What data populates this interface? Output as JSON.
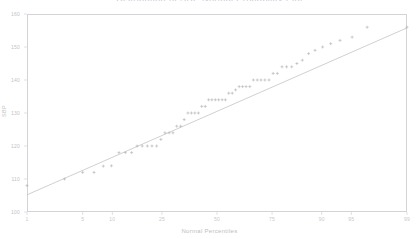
{
  "chart_data": {
    "type": "scatter",
    "title": "Distribution of SBP  Normal Probability Plot",
    "xlabel": "Normal Percentiles",
    "ylabel": "SBP",
    "xlim": [
      1,
      99
    ],
    "ylim": [
      100,
      160
    ],
    "grid": false,
    "legend": "none",
    "marker": "plus",
    "marker_color": "#b0b0b6",
    "line_color": "#c0c0c6",
    "frame_color": "#d4d4d8",
    "background": "#ffffff",
    "xticks": [
      1,
      5,
      10,
      25,
      50,
      75,
      90,
      95,
      99
    ],
    "xtick_labels": [
      "1",
      "5",
      "10",
      "25",
      "50",
      "75",
      "90",
      "95",
      "99"
    ],
    "yticks": [
      100,
      110,
      120,
      130,
      140,
      150,
      160
    ],
    "ytick_labels": [
      "100",
      "110",
      "120",
      "130",
      "140",
      "150",
      "160"
    ],
    "reference_line": {
      "description": "normal reference line",
      "x": [
        1,
        99
      ],
      "y": [
        105.2,
        155.8
      ]
    },
    "series": [
      {
        "name": "SBP quantiles",
        "x": [
          1.0,
          3.1,
          5.0,
          6.6,
          8.2,
          9.8,
          11.5,
          13.1,
          14.8,
          16.4,
          18.0,
          19.7,
          21.3,
          23.0,
          24.6,
          26.2,
          27.9,
          29.5,
          31.1,
          32.8,
          34.4,
          36.1,
          37.7,
          39.3,
          41.0,
          42.6,
          44.3,
          45.9,
          47.5,
          49.2,
          50.8,
          52.5,
          54.1,
          55.7,
          57.4,
          59.0,
          60.7,
          62.3,
          63.9,
          65.6,
          67.2,
          68.9,
          70.5,
          72.1,
          73.8,
          75.4,
          77.0,
          78.7,
          80.3,
          82.0,
          83.6,
          85.2,
          86.9,
          88.5,
          90.2,
          91.8,
          93.4,
          95.1,
          96.7,
          99.0
        ],
        "y": [
          108.0,
          110.0,
          112.0,
          112.0,
          113.9,
          114.0,
          118.0,
          118.0,
          118.0,
          120.0,
          120.0,
          120.0,
          120.0,
          120.0,
          122.0,
          124.0,
          124.0,
          124.0,
          126.0,
          126.0,
          128.0,
          130.0,
          130.0,
          130.0,
          130.0,
          132.0,
          132.0,
          134.0,
          134.0,
          134.0,
          134.0,
          134.0,
          134.0,
          136.0,
          136.0,
          137.0,
          138.0,
          138.0,
          138.0,
          138.0,
          140.0,
          140.0,
          140.0,
          140.0,
          140.0,
          142.0,
          142.0,
          144.0,
          144.0,
          144.0,
          145.0,
          146.0,
          148.0,
          149.0,
          150.0,
          151.0,
          152.0,
          153.0,
          156.0,
          156.0
        ]
      }
    ]
  },
  "figure": {
    "title": "Distribution of SBP  Normal Probability Plot"
  }
}
